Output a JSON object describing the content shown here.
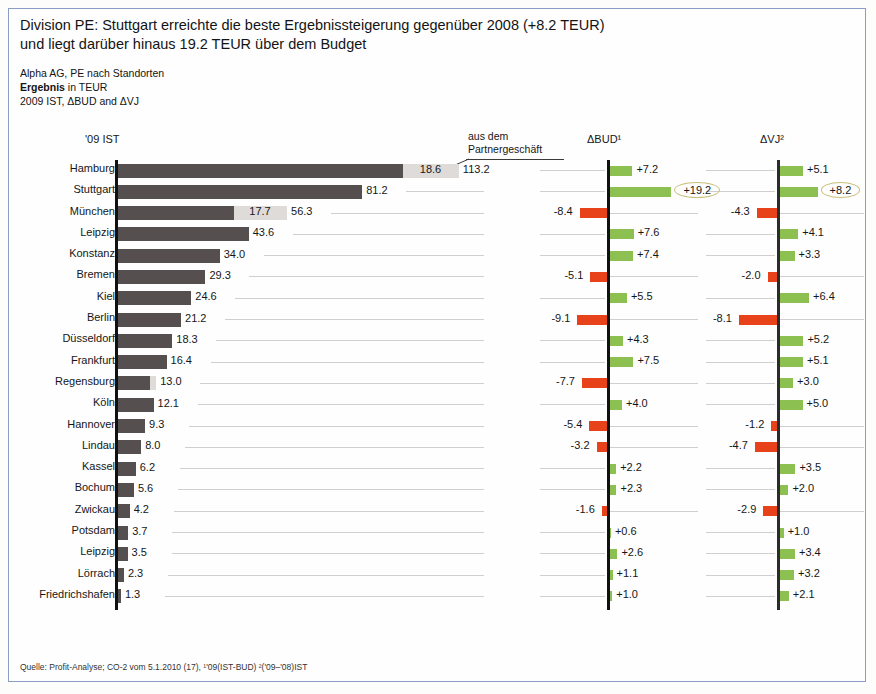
{
  "header": {
    "headline_line1": "Division PE: Stuttgart erreichte die beste Ergebnissteigerung gegenüber 2008 (+8.2 TEUR)",
    "headline_line2": "und liegt darüber hinaus 19.2 TEUR über dem Budget",
    "sub_line1": "Alpha AG, PE nach Standorten",
    "sub_line2_bold": "Ergebnis",
    "sub_line2_rest": " in TEUR",
    "sub_line3": "2009 IST, ΔBUD and ΔVJ"
  },
  "annotation": {
    "line1": "aus dem",
    "line2": "Partnergeschäft"
  },
  "columns": {
    "ist": "'09 IST",
    "bud": "ΔBUD¹",
    "vj": "ΔVJ²"
  },
  "footer": {
    "text": "Quelle: Profit-Analyse; CO-2 vom 5.1.2010 (17),  ¹'09(IST-BUD)  ²('09–'08)IST"
  },
  "colors": {
    "bar_dark": "#554f4f",
    "bar_light": "#dedbd8",
    "positive": "#8cc152",
    "negative": "#e8421b",
    "axis": "#111111",
    "grid": "#cfcfcf",
    "callout_ring": "#c9bf7a",
    "frame": "#8b9dc3"
  },
  "chart_data": {
    "type": "bar",
    "title": "Division PE: Stuttgart erreichte die beste Ergebnissteigerung gegenüber 2008 (+8.2 TEUR) und liegt darüber hinaus 19.2 TEUR über dem Budget",
    "subtitle": "Alpha AG, PE nach Standorten — Ergebnis in TEUR — 2009 IST, ΔBUD and ΔVJ",
    "xlabel": "",
    "ylabel": "",
    "grid": true,
    "legend": "none",
    "orientation": "horizontal",
    "panels": [
      {
        "key": "ist",
        "header": "'09 IST",
        "type": "stacked-bar",
        "max": 113.2,
        "note": "light segment = aus dem Partnergeschäft"
      },
      {
        "key": "bud",
        "header": "ΔBUD¹",
        "type": "diverging-bar",
        "max_abs": 19.2
      },
      {
        "key": "vj",
        "header": "ΔVJ²",
        "type": "diverging-bar",
        "max_abs": 8.2
      }
    ],
    "categories": [
      "Hamburg",
      "Stuttgart",
      "München",
      "Leipzig",
      "Konstanz",
      "Bremen",
      "Kiel",
      "Berlin",
      "Düsseldorf",
      "Frankfurt",
      "Regensburg",
      "Köln",
      "Hannover",
      "Lindau",
      "Kassel",
      "Bochum",
      "Zwickau",
      "Potsdam",
      "Leipzig",
      "Lörrach",
      "Friedrichshafen"
    ],
    "rows": [
      {
        "label": "Hamburg",
        "ist_total": 113.2,
        "ist_label": "113.2",
        "ist_partner": 18.6,
        "ist_partner_label": "18.6",
        "bud": 7.2,
        "bud_label": "+7.2",
        "bud_highlight": false,
        "vj": 5.1,
        "vj_label": "+5.1",
        "vj_highlight": false
      },
      {
        "label": "Stuttgart",
        "ist_total": 81.2,
        "ist_label": "81.2",
        "ist_partner": 0,
        "ist_partner_label": "",
        "bud": 19.2,
        "bud_label": "+19.2",
        "bud_highlight": true,
        "vj": 8.2,
        "vj_label": "+8.2",
        "vj_highlight": true
      },
      {
        "label": "München",
        "ist_total": 56.3,
        "ist_label": "56.3",
        "ist_partner": 17.7,
        "ist_partner_label": "17.7",
        "bud": -8.4,
        "bud_label": "-8.4",
        "bud_highlight": false,
        "vj": -4.3,
        "vj_label": "-4.3",
        "vj_highlight": false
      },
      {
        "label": "Leipzig",
        "ist_total": 43.6,
        "ist_label": "43.6",
        "ist_partner": 0,
        "ist_partner_label": "",
        "bud": 7.6,
        "bud_label": "+7.6",
        "bud_highlight": false,
        "vj": 4.1,
        "vj_label": "+4.1",
        "vj_highlight": false
      },
      {
        "label": "Konstanz",
        "ist_total": 34.0,
        "ist_label": "34.0",
        "ist_partner": 0,
        "ist_partner_label": "",
        "bud": 7.4,
        "bud_label": "+7.4",
        "bud_highlight": false,
        "vj": 3.3,
        "vj_label": "+3.3",
        "vj_highlight": false
      },
      {
        "label": "Bremen",
        "ist_total": 29.3,
        "ist_label": "29.3",
        "ist_partner": 0,
        "ist_partner_label": "",
        "bud": -5.1,
        "bud_label": "-5.1",
        "bud_highlight": false,
        "vj": -2.0,
        "vj_label": "-2.0",
        "vj_highlight": false
      },
      {
        "label": "Kiel",
        "ist_total": 24.6,
        "ist_label": "24.6",
        "ist_partner": 0,
        "ist_partner_label": "",
        "bud": 5.5,
        "bud_label": "+5.5",
        "bud_highlight": false,
        "vj": 6.4,
        "vj_label": "+6.4",
        "vj_highlight": false
      },
      {
        "label": "Berlin",
        "ist_total": 21.2,
        "ist_label": "21.2",
        "ist_partner": 0,
        "ist_partner_label": "",
        "bud": -9.1,
        "bud_label": "-9.1",
        "bud_highlight": false,
        "vj": -8.1,
        "vj_label": "-8.1",
        "vj_highlight": false
      },
      {
        "label": "Düsseldorf",
        "ist_total": 18.3,
        "ist_label": "18.3",
        "ist_partner": 0,
        "ist_partner_label": "",
        "bud": 4.3,
        "bud_label": "+4.3",
        "bud_highlight": false,
        "vj": 5.2,
        "vj_label": "+5.2",
        "vj_highlight": false
      },
      {
        "label": "Frankfurt",
        "ist_total": 16.4,
        "ist_label": "16.4",
        "ist_partner": 0,
        "ist_partner_label": "",
        "bud": 7.5,
        "bud_label": "+7.5",
        "bud_highlight": false,
        "vj": 5.1,
        "vj_label": "+5.1",
        "vj_highlight": false
      },
      {
        "label": "Regensburg",
        "ist_total": 13.0,
        "ist_label": "13.0",
        "ist_partner": 2.2,
        "ist_partner_label": "",
        "bud": -7.7,
        "bud_label": "-7.7",
        "bud_highlight": false,
        "vj": 3.0,
        "vj_label": "+3.0",
        "vj_highlight": false
      },
      {
        "label": "Köln",
        "ist_total": 12.1,
        "ist_label": "12.1",
        "ist_partner": 0,
        "ist_partner_label": "",
        "bud": 4.0,
        "bud_label": "+4.0",
        "bud_highlight": false,
        "vj": 5.0,
        "vj_label": "+5.0",
        "vj_highlight": false
      },
      {
        "label": "Hannover",
        "ist_total": 9.3,
        "ist_label": "9.3",
        "ist_partner": 0,
        "ist_partner_label": "",
        "bud": -5.4,
        "bud_label": "-5.4",
        "bud_highlight": false,
        "vj": -1.2,
        "vj_label": "-1.2",
        "vj_highlight": false
      },
      {
        "label": "Lindau",
        "ist_total": 8.0,
        "ist_label": "8.0",
        "ist_partner": 0,
        "ist_partner_label": "",
        "bud": -3.2,
        "bud_label": "-3.2",
        "bud_highlight": false,
        "vj": -4.7,
        "vj_label": "-4.7",
        "vj_highlight": false
      },
      {
        "label": "Kassel",
        "ist_total": 6.2,
        "ist_label": "6.2",
        "ist_partner": 0,
        "ist_partner_label": "",
        "bud": 2.2,
        "bud_label": "+2.2",
        "bud_highlight": false,
        "vj": 3.5,
        "vj_label": "+3.5",
        "vj_highlight": false
      },
      {
        "label": "Bochum",
        "ist_total": 5.6,
        "ist_label": "5.6",
        "ist_partner": 0,
        "ist_partner_label": "",
        "bud": 2.3,
        "bud_label": "+2.3",
        "bud_highlight": false,
        "vj": 2.0,
        "vj_label": "+2.0",
        "vj_highlight": false
      },
      {
        "label": "Zwickau",
        "ist_total": 4.2,
        "ist_label": "4.2",
        "ist_partner": 0,
        "ist_partner_label": "",
        "bud": -1.6,
        "bud_label": "-1.6",
        "bud_highlight": false,
        "vj": -2.9,
        "vj_label": "-2.9",
        "vj_highlight": false
      },
      {
        "label": "Potsdam",
        "ist_total": 3.7,
        "ist_label": "3.7",
        "ist_partner": 0,
        "ist_partner_label": "",
        "bud": 0.6,
        "bud_label": "+0.6",
        "bud_highlight": false,
        "vj": 1.0,
        "vj_label": "+1.0",
        "vj_highlight": false
      },
      {
        "label": "Leipzig",
        "ist_total": 3.5,
        "ist_label": "3.5",
        "ist_partner": 0,
        "ist_partner_label": "",
        "bud": 2.6,
        "bud_label": "+2.6",
        "bud_highlight": false,
        "vj": 3.4,
        "vj_label": "+3.4",
        "vj_highlight": false
      },
      {
        "label": "Lörrach",
        "ist_total": 2.3,
        "ist_label": "2.3",
        "ist_partner": 0,
        "ist_partner_label": "",
        "bud": 1.1,
        "bud_label": "+1.1",
        "bud_highlight": false,
        "vj": 3.2,
        "vj_label": "+3.2",
        "vj_highlight": false
      },
      {
        "label": "Friedrichshafen",
        "ist_total": 1.3,
        "ist_label": "1.3",
        "ist_partner": 0,
        "ist_partner_label": "",
        "bud": 1.0,
        "bud_label": "+1.0",
        "bud_highlight": false,
        "vj": 2.1,
        "vj_label": "+2.1",
        "vj_highlight": false
      }
    ]
  }
}
